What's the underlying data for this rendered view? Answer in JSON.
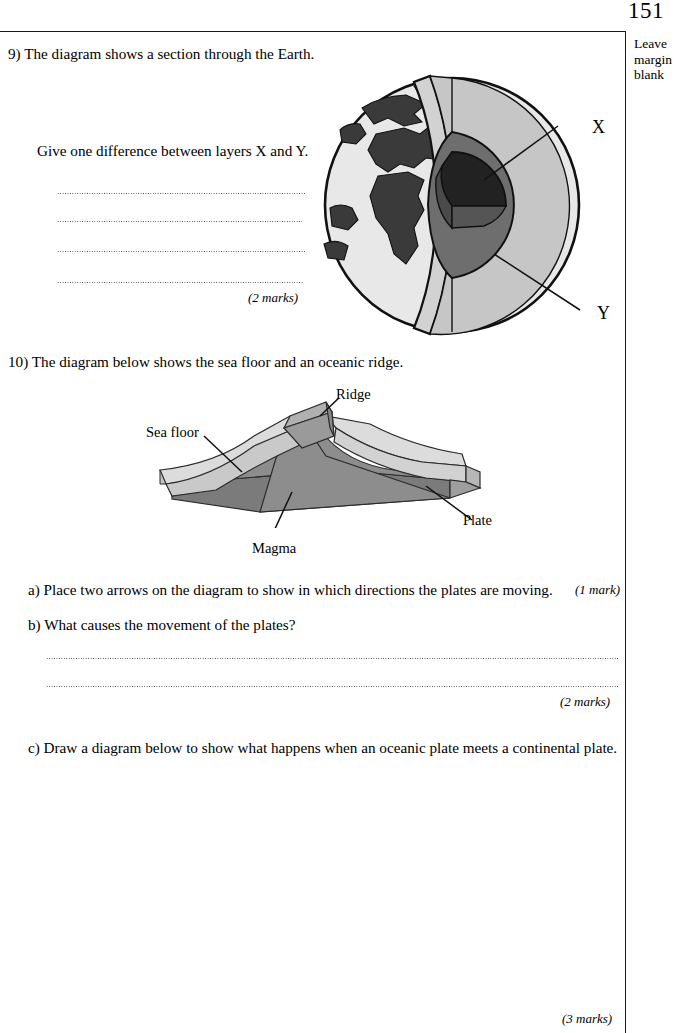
{
  "page": {
    "number": "151",
    "margin_note_lines": [
      "Leave",
      "margin",
      "blank"
    ]
  },
  "questions": [
    {
      "id": "q9",
      "number": "9)",
      "stem": "9) The diagram shows a section through the Earth.",
      "prompt": "Give one difference between layers X and Y.",
      "answer_lines": 4,
      "marks": "(2 marks)",
      "figure": {
        "name": "earth-cross-section",
        "labels": [
          {
            "text": "X",
            "target": "inner-core"
          },
          {
            "text": "Y",
            "target": "outer-core"
          }
        ],
        "colors": {
          "ocean": "#e8e8e8",
          "land": "#3a3a3a",
          "mantle": "#c6c6c6",
          "outer_core": "#6e6e6e",
          "inner_core": "#222222",
          "outline": "#111111"
        }
      }
    },
    {
      "id": "q10",
      "number": "10)",
      "stem": "10) The diagram below shows the sea floor and an oceanic ridge.",
      "figure": {
        "name": "oceanic-ridge-block-diagram",
        "labels": [
          {
            "text": "Ridge",
            "target": "ridge-crest"
          },
          {
            "text": "Sea floor",
            "target": "sea-floor-surface"
          },
          {
            "text": "Magma",
            "target": "magma-wedge"
          },
          {
            "text": "Plate",
            "target": "plate-edge"
          }
        ],
        "colors": {
          "plate_top": "#dcdcdc",
          "plate_side": "#b7b7b7",
          "magma": "#8d8d8d",
          "magma_dark": "#7b7b7b",
          "ridge_block": "#9a9a9a",
          "outline": "#2b2b2b"
        }
      },
      "parts": [
        {
          "id": "q10a",
          "text": "a) Place two arrows on the diagram to show in which directions the plates are moving.",
          "marks": "(1 mark)",
          "answer_lines": 0
        },
        {
          "id": "q10b",
          "text": "b) What causes the movement of the plates?",
          "marks": "(2 marks)",
          "answer_lines": 2
        },
        {
          "id": "q10c",
          "text": "c) Draw a diagram below to show what happens when an oceanic plate meets a continental plate.",
          "marks": "(3 marks)",
          "answer_lines": 0
        }
      ]
    }
  ]
}
